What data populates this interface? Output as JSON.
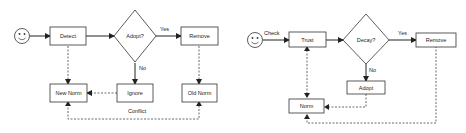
{
  "diagrams": [
    {
      "name": "norm-detection-flow",
      "start_actor": "smiley-face",
      "nodes": {
        "detect": "Detect",
        "decision": "Adopt?",
        "remove": "Remove",
        "new_norm": "New Norm",
        "ignore": "Ignore",
        "old_norm": "Old Norm"
      },
      "edge_labels": {
        "yes": "Yes",
        "no": "No",
        "conflict": "Conflict"
      },
      "edges": [
        {
          "from": "start",
          "to": "Detect",
          "style": "solid"
        },
        {
          "from": "Detect",
          "to": "Adopt?",
          "style": "solid"
        },
        {
          "from": "Adopt?",
          "to": "Remove",
          "style": "solid",
          "label": "Yes"
        },
        {
          "from": "Adopt?",
          "to": "Ignore",
          "style": "solid",
          "label": "No"
        },
        {
          "from": "Detect",
          "to": "New Norm",
          "style": "dashed"
        },
        {
          "from": "Ignore",
          "to": "New Norm",
          "style": "dashed"
        },
        {
          "from": "Remove",
          "to": "Old Norm",
          "style": "dashed"
        },
        {
          "from": "Old Norm",
          "to": "New Norm",
          "style": "dashed",
          "label": "Conflict",
          "bidirectional": true
        }
      ]
    },
    {
      "name": "norm-trust-flow",
      "start_actor": "smiley-face",
      "nodes": {
        "trust": "Trust",
        "decision": "Decay?",
        "remove": "Remove",
        "adopt": "Adopt",
        "norm": "Norm"
      },
      "edge_labels": {
        "check": "Check",
        "yes": "Yes",
        "no": "No"
      },
      "edges": [
        {
          "from": "start",
          "to": "Trust",
          "style": "solid",
          "label": "Check"
        },
        {
          "from": "Trust",
          "to": "Decay?",
          "style": "solid"
        },
        {
          "from": "Decay?",
          "to": "Remove",
          "style": "solid",
          "label": "Yes"
        },
        {
          "from": "Decay?",
          "to": "Adopt",
          "style": "solid",
          "label": "No"
        },
        {
          "from": "Trust",
          "to": "Norm",
          "style": "dashed",
          "bidirectional": true
        },
        {
          "from": "Adopt",
          "to": "Norm",
          "style": "dashed"
        },
        {
          "from": "Remove",
          "to": "Norm",
          "style": "dashed"
        }
      ]
    }
  ]
}
